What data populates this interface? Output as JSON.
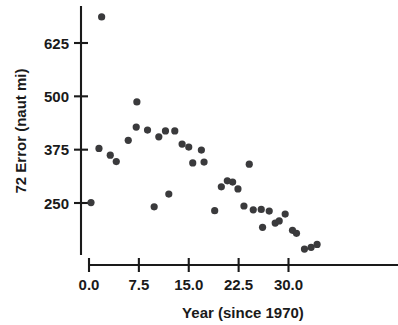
{
  "chart_data": {
    "type": "scatter",
    "title": "",
    "subtitle": "",
    "xlabel": "Year (since 1970)",
    "ylabel": "72 Error (naut mi)",
    "xlim": [
      -1.0,
      35.5
    ],
    "ylim": [
      110,
      700
    ],
    "xticks": [
      0.0,
      7.5,
      15.0,
      22.5,
      30.0
    ],
    "xtick_labels": [
      "0.0",
      "7.5",
      "15.0",
      "22.5",
      "30.0"
    ],
    "yticks": [
      250,
      375,
      500,
      625
    ],
    "ytick_labels": [
      "250",
      "375",
      "500",
      "625"
    ],
    "grid": false,
    "legend": null,
    "marker": "filled-circle",
    "marker_color": "#3a3a3c",
    "axis_color": "#1a1a1a",
    "series": [
      {
        "name": "72 hr forecast error",
        "points": [
          {
            "x": 0.3,
            "y": 251
          },
          {
            "x": 1.5,
            "y": 378
          },
          {
            "x": 1.9,
            "y": 686
          },
          {
            "x": 3.2,
            "y": 362
          },
          {
            "x": 4.1,
            "y": 347
          },
          {
            "x": 5.9,
            "y": 397
          },
          {
            "x": 7.1,
            "y": 428
          },
          {
            "x": 7.2,
            "y": 487
          },
          {
            "x": 8.8,
            "y": 421
          },
          {
            "x": 9.8,
            "y": 241
          },
          {
            "x": 10.5,
            "y": 405
          },
          {
            "x": 11.5,
            "y": 419
          },
          {
            "x": 12.0,
            "y": 271
          },
          {
            "x": 12.9,
            "y": 419
          },
          {
            "x": 14.0,
            "y": 388
          },
          {
            "x": 15.0,
            "y": 381
          },
          {
            "x": 15.6,
            "y": 344
          },
          {
            "x": 16.9,
            "y": 374
          },
          {
            "x": 17.3,
            "y": 346
          },
          {
            "x": 18.9,
            "y": 232
          },
          {
            "x": 19.9,
            "y": 288
          },
          {
            "x": 20.8,
            "y": 302
          },
          {
            "x": 21.6,
            "y": 299
          },
          {
            "x": 22.4,
            "y": 283
          },
          {
            "x": 23.3,
            "y": 243
          },
          {
            "x": 24.1,
            "y": 341
          },
          {
            "x": 24.7,
            "y": 234
          },
          {
            "x": 25.9,
            "y": 235
          },
          {
            "x": 26.1,
            "y": 193
          },
          {
            "x": 27.1,
            "y": 231
          },
          {
            "x": 28.0,
            "y": 203
          },
          {
            "x": 28.6,
            "y": 208
          },
          {
            "x": 29.5,
            "y": 224
          },
          {
            "x": 30.6,
            "y": 186
          },
          {
            "x": 31.2,
            "y": 179
          },
          {
            "x": 32.4,
            "y": 142
          },
          {
            "x": 33.4,
            "y": 146
          },
          {
            "x": 34.3,
            "y": 153
          }
        ]
      }
    ]
  },
  "axes": {
    "y_axis_title": "72 Error (naut mi)",
    "x_axis_title": "Year (since 1970)"
  }
}
